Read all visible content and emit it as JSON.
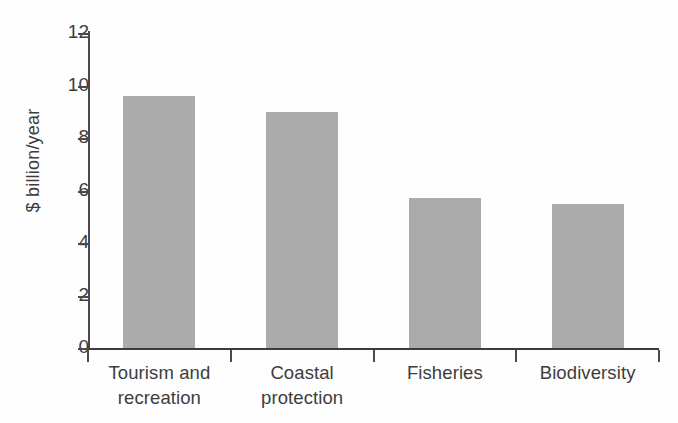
{
  "chart_data": {
    "type": "bar",
    "title": "",
    "subtitle": "",
    "xlabel": "",
    "ylabel": "$ billion/year",
    "categories": [
      "Tourism and recreation",
      "Coastal protection",
      "Fisheries",
      "Biodiversity"
    ],
    "category_lines": [
      [
        "Tourism and",
        "recreation"
      ],
      [
        "Coastal",
        "protection"
      ],
      [
        "Fisheries"
      ],
      [
        "Biodiversity"
      ]
    ],
    "values": [
      9.6,
      9.0,
      5.7,
      5.5
    ],
    "ylim": [
      0,
      12
    ],
    "ytick_values": [
      0,
      2,
      4,
      6,
      8,
      10,
      12
    ],
    "ytick_labels": [
      "0",
      "2",
      "4",
      "6",
      "8",
      "10",
      "12"
    ],
    "grid": false,
    "legend": null,
    "bar_color": "#ababab",
    "axis_color": "#4a4a4a",
    "text_color": "#3d3d3d",
    "background": "#ffffff"
  }
}
